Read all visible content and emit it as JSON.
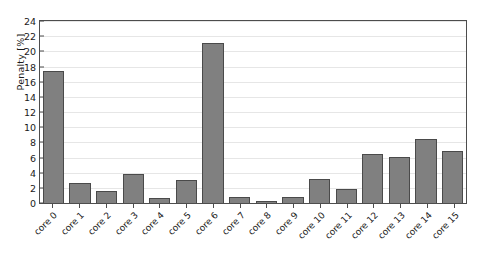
{
  "chart_data": {
    "type": "bar",
    "title": "",
    "xlabel": "",
    "ylabel": "Penalty [%]",
    "ylim": [
      0,
      24
    ],
    "yticks": [
      0,
      2,
      4,
      6,
      8,
      10,
      12,
      14,
      16,
      18,
      20,
      22,
      24
    ],
    "grid": "horizontal",
    "legend": "none",
    "bar_color": "#808080",
    "bar_edge_color": "#4a4a4a",
    "categories": [
      "core 0",
      "core 1",
      "core 2",
      "core 3",
      "core 4",
      "core 5",
      "core 6",
      "core 7",
      "core 8",
      "core 9",
      "core 10",
      "core 11",
      "core 12",
      "core 13",
      "core 14",
      "core 15"
    ],
    "values": [
      17.4,
      2.7,
      1.65,
      3.8,
      0.65,
      3.0,
      21.1,
      0.8,
      0.2,
      0.85,
      3.15,
      1.8,
      6.45,
      6.1,
      8.5,
      6.8
    ]
  }
}
